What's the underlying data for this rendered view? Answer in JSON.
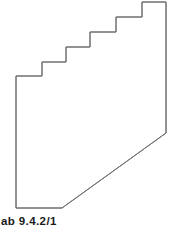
{
  "figure": {
    "kind": "technical-line-drawing",
    "caption": "ab 9.4.2/1",
    "canvas": {
      "width": 174,
      "height": 227
    },
    "style": {
      "background_color": "#ffffff",
      "stroke_color": "#6e6e6e",
      "stroke_width": 1,
      "fill": "none",
      "caption_color": "#1a1a1a"
    },
    "outline_points": [
      {
        "x": 16,
        "y": 76,
        "label": "step-5-tread-left-end"
      },
      {
        "x": 16,
        "y": 208,
        "label": "bottom-left-corner"
      },
      {
        "x": 62,
        "y": 208,
        "label": "bottom-edge-right-end"
      },
      {
        "x": 166,
        "y": 133,
        "label": "diagonal-top-right-end"
      },
      {
        "x": 166,
        "y": 2,
        "label": "top-right-corner"
      },
      {
        "x": 142,
        "y": 2,
        "label": "top-edge-left-end"
      },
      {
        "x": 142,
        "y": 17,
        "label": "step-1-riser-bottom"
      },
      {
        "x": 116,
        "y": 17,
        "label": "step-1-tread-left-end"
      },
      {
        "x": 116,
        "y": 32,
        "label": "step-2-riser-bottom"
      },
      {
        "x": 90,
        "y": 32,
        "label": "step-2-tread-left-end"
      },
      {
        "x": 90,
        "y": 47,
        "label": "step-3-riser-bottom"
      },
      {
        "x": 66,
        "y": 47,
        "label": "step-3-tread-left-end"
      },
      {
        "x": 66,
        "y": 62,
        "label": "step-4-riser-bottom"
      },
      {
        "x": 42,
        "y": 62,
        "label": "step-4-tread-left-end"
      },
      {
        "x": 42,
        "y": 76,
        "label": "step-5-riser-bottom"
      }
    ],
    "step_count": 5,
    "segments": [
      {
        "name": "left-vertical-edge",
        "from": [
          16,
          76
        ],
        "to": [
          16,
          208
        ]
      },
      {
        "name": "bottom-horizontal-edge",
        "from": [
          16,
          208
        ],
        "to": [
          62,
          208
        ]
      },
      {
        "name": "diagonal-edge",
        "from": [
          62,
          208
        ],
        "to": [
          166,
          133
        ]
      },
      {
        "name": "right-vertical-edge",
        "from": [
          166,
          133
        ],
        "to": [
          166,
          2
        ]
      },
      {
        "name": "top-horizontal-edge",
        "from": [
          166,
          2
        ],
        "to": [
          142,
          2
        ]
      },
      {
        "name": "staircase-edge",
        "from": [
          142,
          2
        ],
        "to": [
          16,
          76
        ]
      }
    ]
  }
}
